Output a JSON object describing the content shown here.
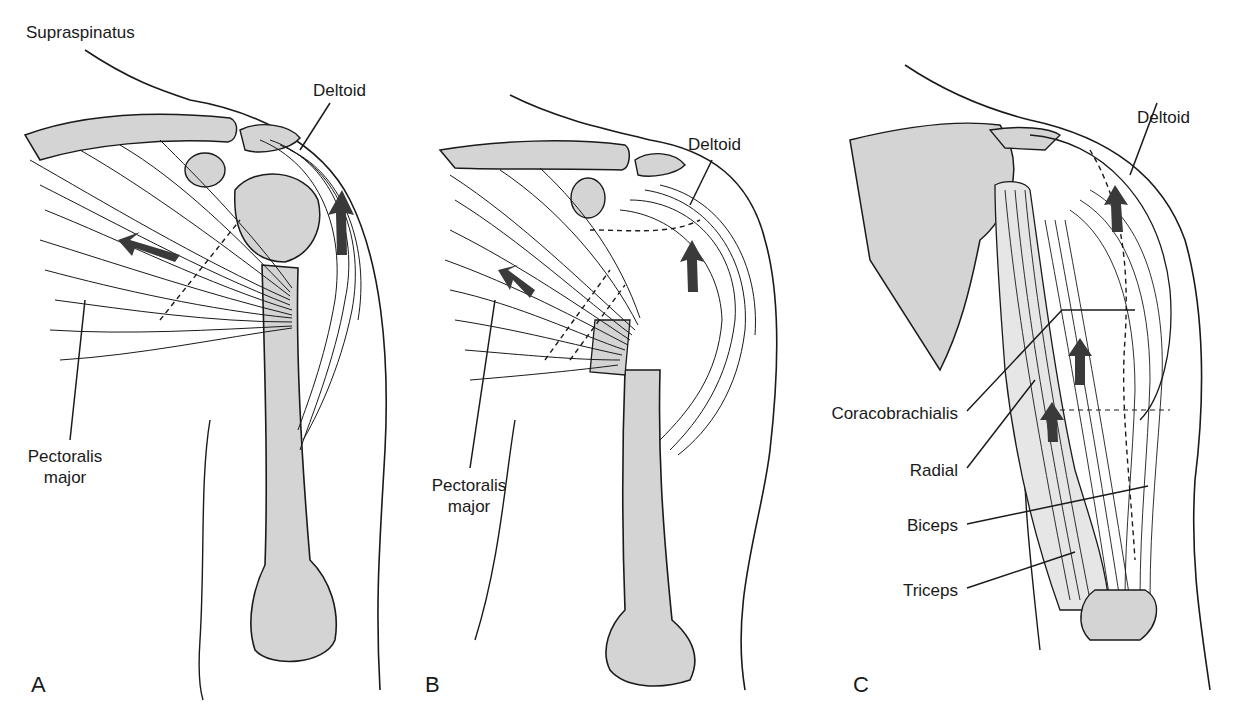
{
  "figure": {
    "panels": [
      {
        "id": "A",
        "letter": "A",
        "labels": {
          "supraspinatus": "Supraspinatus",
          "deltoid": "Deltoid",
          "pectoralis_line1": "Pectoralis",
          "pectoralis_line2": "major"
        }
      },
      {
        "id": "B",
        "letter": "B",
        "labels": {
          "deltoid": "Deltoid",
          "pectoralis_line1": "Pectoralis",
          "pectoralis_line2": "major"
        }
      },
      {
        "id": "C",
        "letter": "C",
        "labels": {
          "deltoid": "Deltoid",
          "coracobrachialis": "Coracobrachialis",
          "radial": "Radial",
          "biceps": "Biceps",
          "triceps": "Triceps"
        }
      }
    ],
    "colors": {
      "bone_fill": "#d4d4d4",
      "line": "#1a1a1a",
      "arrow": "#3a3a3a",
      "background": "#ffffff"
    }
  }
}
